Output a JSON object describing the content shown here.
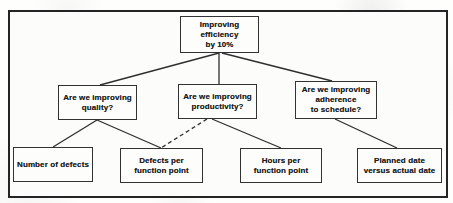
{
  "figure": {
    "type": "tree-diagram",
    "colors": {
      "background": "#fcfcfb",
      "frame_border": "#242424",
      "box_border": "#323232",
      "line": "#2e2e2e",
      "text": "#1c1c1c"
    },
    "nodes": {
      "goal": {
        "lines": [
          "Improving",
          "efficiency",
          "by 10%"
        ]
      },
      "q_quality": {
        "lines": [
          "Are we improving",
          "quality?"
        ]
      },
      "q_productivity": {
        "lines": [
          "Are we improving",
          "productivity?"
        ]
      },
      "q_schedule": {
        "lines": [
          "Are we improving",
          "adherence",
          "to schedule?"
        ]
      },
      "m_defects": {
        "lines": [
          "Number of defects"
        ]
      },
      "m_defects_fp": {
        "lines": [
          "Defects per",
          "function point"
        ]
      },
      "m_hours_fp": {
        "lines": [
          "Hours per",
          "function point"
        ]
      },
      "m_planned": {
        "lines": [
          "Planned date",
          "versus actual date"
        ]
      }
    },
    "edges": [
      {
        "from": "goal",
        "to": "q_quality",
        "style": "solid"
      },
      {
        "from": "goal",
        "to": "q_productivity",
        "style": "solid"
      },
      {
        "from": "goal",
        "to": "q_schedule",
        "style": "solid"
      },
      {
        "from": "q_quality",
        "to": "m_defects",
        "style": "solid"
      },
      {
        "from": "q_quality",
        "to": "m_defects_fp",
        "style": "solid"
      },
      {
        "from": "q_productivity",
        "to": "m_defects_fp",
        "style": "dashed"
      },
      {
        "from": "q_productivity",
        "to": "m_hours_fp",
        "style": "solid"
      },
      {
        "from": "q_schedule",
        "to": "m_planned",
        "style": "solid"
      }
    ]
  }
}
